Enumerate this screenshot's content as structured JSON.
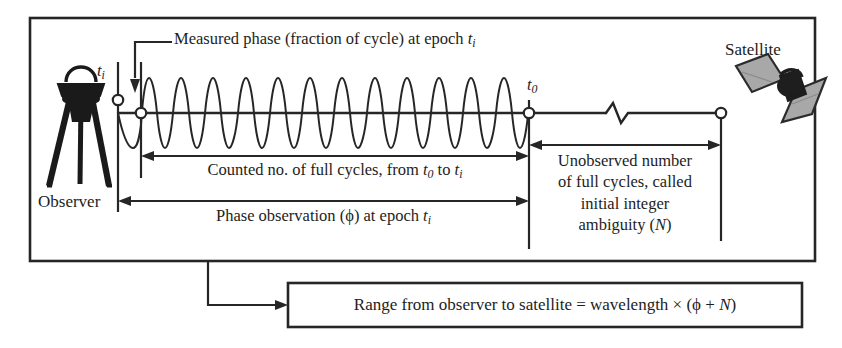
{
  "diagram": {
    "title_semantic": "gnss-carrier-phase-ambiguity-diagram",
    "labels": {
      "measured_phase": {
        "text_parts": [
          "Measured phase (fraction of cycle) at epoch ",
          "t",
          "i"
        ],
        "full": "Measured phase (fraction of cycle) at epoch ti"
      },
      "satellite": "Satellite",
      "observer": "Observer",
      "epoch_i": {
        "base": "t",
        "sub": "i"
      },
      "epoch_0": {
        "base": "t",
        "sub": "0"
      },
      "counted_cycles": {
        "full": "Counted no. of full cycles, from t0 to ti",
        "p1": "Counted no. of full cycles, from ",
        "v1": "t",
        "s1": "0",
        "p2": " to ",
        "v2": "t",
        "s2": "i"
      },
      "phase_observation": {
        "full": "Phase observation (ϕ) at epoch ti",
        "p1": "Phase observation (ϕ) at epoch ",
        "v1": "t",
        "s1": "i"
      },
      "unobserved": {
        "line1": "Unobserved number",
        "line2": "of full cycles, called",
        "line3": "initial integer",
        "line4_p1": "ambiguity (",
        "line4_v": "N",
        "line4_p2": ")"
      }
    },
    "formula_box": {
      "p1": "Range from observer to satellite = wavelength × (ϕ + ",
      "v1": "N",
      "p2": ")",
      "full": "Range from observer to satellite = wavelength × (ϕ + N)"
    },
    "colors": {
      "stroke": "#262626",
      "background": "#ffffff",
      "satellite_panel": "#a8a8a8",
      "satellite_panel_edge": "#2b2b2b",
      "satellite_body": "#1e1e1e",
      "observer_body": "#1a1a1a",
      "marker_fill": "#ffffff"
    },
    "geometry": {
      "main_box": {
        "x": 30,
        "y": 18,
        "w": 785,
        "h": 243
      },
      "formula_box": {
        "x": 288,
        "y": 283,
        "w": 514,
        "h": 44
      },
      "baseline_y": 113,
      "t_i_x": 118,
      "phase_start_x": 141,
      "t_0_x": 529,
      "satellite_node_x": 721,
      "wave_cycles": 12,
      "wave_amplitude": 35,
      "break_symbol_x": 615
    }
  }
}
